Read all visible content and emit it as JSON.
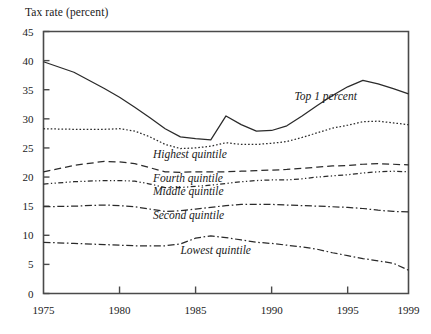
{
  "chart_data": {
    "type": "line",
    "title": "Tax rate (percent)",
    "xlabel": "",
    "ylabel": "Tax rate (percent)",
    "xlim": [
      1975,
      1999
    ],
    "ylim": [
      0,
      45
    ],
    "ytick_labels": [
      "0",
      "5",
      "10",
      "15",
      "20",
      "25",
      "30",
      "35",
      "40",
      "45"
    ],
    "ytick_values": [
      0,
      5,
      10,
      15,
      20,
      25,
      30,
      35,
      40,
      45
    ],
    "xtick_labels": [
      "1975",
      "1980",
      "1985",
      "1990",
      "1995",
      "1999"
    ],
    "xtick_values": [
      1975,
      1980,
      1985,
      1990,
      1995,
      1999
    ],
    "grid": false,
    "legend_position": "inline-annotations",
    "x": [
      1975,
      1977,
      1979,
      1980,
      1981,
      1982,
      1983,
      1984,
      1985,
      1986,
      1987,
      1988,
      1989,
      1990,
      1991,
      1992,
      1993,
      1994,
      1995,
      1996,
      1997,
      1998,
      1999
    ],
    "series": [
      {
        "name": "Top 1 percent",
        "label": "Top 1 percent",
        "line_style": "solid",
        "values": [
          39.8,
          38.0,
          35.2,
          33.7,
          32.0,
          30.2,
          28.3,
          26.9,
          26.6,
          26.4,
          30.5,
          29.0,
          27.9,
          28.0,
          28.8,
          30.5,
          32.3,
          34.0,
          35.5,
          36.6,
          36.0,
          35.2,
          34.3
        ]
      },
      {
        "name": "Highest quintile",
        "label": "Highest quintile",
        "line_style": "dotted",
        "values": [
          28.3,
          28.2,
          28.2,
          28.3,
          27.9,
          26.9,
          25.6,
          24.9,
          25.0,
          25.3,
          25.9,
          25.6,
          25.6,
          25.8,
          26.1,
          26.8,
          27.6,
          28.4,
          28.9,
          29.5,
          29.6,
          29.3,
          29.0
        ]
      },
      {
        "name": "Fourth quintile",
        "label": "Fourth quintile",
        "line_style": "dashed",
        "values": [
          20.9,
          22.0,
          22.7,
          22.6,
          22.3,
          21.6,
          20.9,
          20.8,
          20.9,
          20.9,
          20.9,
          21.0,
          21.1,
          21.2,
          21.3,
          21.5,
          21.7,
          21.9,
          22.0,
          22.2,
          22.3,
          22.2,
          22.1
        ]
      },
      {
        "name": "Middle quintile",
        "label": "Middle quintile",
        "line_style": "dash-dot-dot",
        "values": [
          18.8,
          19.2,
          19.4,
          19.4,
          19.3,
          18.8,
          18.2,
          18.2,
          18.4,
          18.6,
          18.9,
          19.2,
          19.4,
          19.5,
          19.5,
          19.7,
          20.0,
          20.2,
          20.4,
          20.7,
          20.9,
          21.0,
          20.9
        ]
      },
      {
        "name": "Second quintile",
        "label": "Second quintile",
        "line_style": "dash-dot",
        "values": [
          14.9,
          15.0,
          15.2,
          15.1,
          14.9,
          14.5,
          14.1,
          14.2,
          14.5,
          14.8,
          15.1,
          15.3,
          15.3,
          15.3,
          15.2,
          15.1,
          15.0,
          14.9,
          14.8,
          14.6,
          14.3,
          14.1,
          14.0
        ]
      },
      {
        "name": "Lowest quintile",
        "label": "Lowest quintile",
        "line_style": "dash-dot",
        "values": [
          8.8,
          8.6,
          8.4,
          8.3,
          8.2,
          8.2,
          8.2,
          8.5,
          9.5,
          9.9,
          9.6,
          9.2,
          8.8,
          8.6,
          8.3,
          8.0,
          7.6,
          7.0,
          6.5,
          6.0,
          5.6,
          5.2,
          4.0
        ]
      }
    ],
    "annotations": [
      {
        "text": "Top 1 percent",
        "x": 1991.5,
        "y": 33.2
      },
      {
        "text": "Highest quintile",
        "x": 1982.2,
        "y": 23.3
      },
      {
        "text": "Fourth quintile",
        "x": 1982.2,
        "y": 19.2
      },
      {
        "text": "Middle quintile",
        "x": 1982.2,
        "y": 17.0
      },
      {
        "text": "Second quintile",
        "x": 1982.2,
        "y": 12.8
      },
      {
        "text": "Lowest quintile",
        "x": 1984.0,
        "y": 6.7
      }
    ]
  },
  "colors": {
    "line": "#2a2a2a",
    "axis": "#4a4a4a",
    "text": "#1a1a1a",
    "background": "#ffffff"
  }
}
